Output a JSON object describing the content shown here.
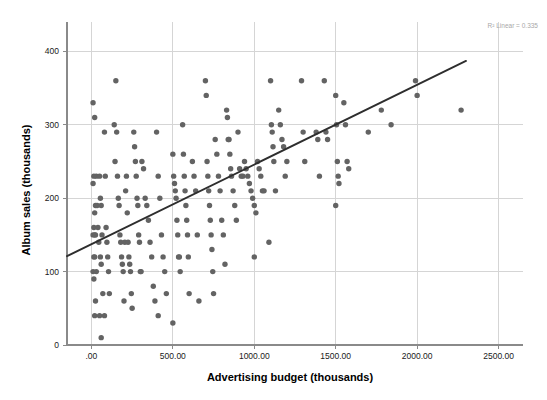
{
  "chart_data": {
    "type": "scatter",
    "title": "",
    "xlabel": "Advertising budget (thousands)",
    "ylabel": "Album sales (thousands)",
    "xlim": [
      -150,
      2650
    ],
    "ylim": [
      0,
      440
    ],
    "grid": true,
    "xticks": [
      0,
      500,
      1000,
      1500,
      2000,
      2500
    ],
    "xticklabels": [
      ".00",
      "500.00",
      "1000.00",
      "1500.00",
      "2000.00",
      "2500.00"
    ],
    "yticks": [
      0,
      100,
      200,
      300,
      400
    ],
    "yticklabels": [
      "0",
      "100",
      "200",
      "300",
      "400"
    ],
    "annotation": "R² Linear = 0.335",
    "annotation_value": 0.335,
    "marker_color": "#636363",
    "fit_line_color": "#2e2e2e",
    "grid_color": "#d5d5d5",
    "axis_color": "#8a8a8a",
    "fit_line": {
      "x0": -150,
      "y0": 121,
      "x1": 2300,
      "y1": 387
    },
    "series": [
      {
        "name": "Album sales",
        "points": [
          [
            10,
            330
          ],
          [
            10,
            220
          ],
          [
            20,
            310
          ],
          [
            15,
            230
          ],
          [
            30,
            230
          ],
          [
            25,
            190
          ],
          [
            20,
            180
          ],
          [
            15,
            160
          ],
          [
            10,
            150
          ],
          [
            20,
            150
          ],
          [
            25,
            150
          ],
          [
            15,
            120
          ],
          [
            20,
            120
          ],
          [
            10,
            100
          ],
          [
            15,
            90
          ],
          [
            30,
            100
          ],
          [
            25,
            60
          ],
          [
            20,
            40
          ],
          [
            35,
            190
          ],
          [
            40,
            160
          ],
          [
            45,
            140
          ],
          [
            50,
            230
          ],
          [
            55,
            200
          ],
          [
            60,
            190
          ],
          [
            65,
            150
          ],
          [
            55,
            120
          ],
          [
            60,
            110
          ],
          [
            70,
            70
          ],
          [
            50,
            40
          ],
          [
            60,
            10
          ],
          [
            80,
            290
          ],
          [
            85,
            230
          ],
          [
            90,
            160
          ],
          [
            95,
            140
          ],
          [
            100,
            120
          ],
          [
            105,
            100
          ],
          [
            110,
            70
          ],
          [
            80,
            40
          ],
          [
            150,
            360
          ],
          [
            140,
            300
          ],
          [
            145,
            250
          ],
          [
            155,
            290
          ],
          [
            160,
            230
          ],
          [
            165,
            200
          ],
          [
            170,
            190
          ],
          [
            175,
            150
          ],
          [
            180,
            140
          ],
          [
            185,
            120
          ],
          [
            190,
            110
          ],
          [
            195,
            100
          ],
          [
            200,
            60
          ],
          [
            205,
            140
          ],
          [
            210,
            210
          ],
          [
            215,
            230
          ],
          [
            220,
            180
          ],
          [
            225,
            140
          ],
          [
            230,
            120
          ],
          [
            235,
            110
          ],
          [
            240,
            100
          ],
          [
            245,
            70
          ],
          [
            250,
            50
          ],
          [
            260,
            290
          ],
          [
            265,
            270
          ],
          [
            270,
            250
          ],
          [
            275,
            230
          ],
          [
            280,
            200
          ],
          [
            285,
            190
          ],
          [
            290,
            150
          ],
          [
            295,
            140
          ],
          [
            300,
            100
          ],
          [
            305,
            100
          ],
          [
            310,
            250
          ],
          [
            320,
            240
          ],
          [
            330,
            200
          ],
          [
            340,
            190
          ],
          [
            350,
            170
          ],
          [
            360,
            140
          ],
          [
            370,
            120
          ],
          [
            380,
            80
          ],
          [
            390,
            60
          ],
          [
            400,
            290
          ],
          [
            410,
            230
          ],
          [
            420,
            200
          ],
          [
            430,
            150
          ],
          [
            440,
            120
          ],
          [
            450,
            100
          ],
          [
            460,
            70
          ],
          [
            410,
            40
          ],
          [
            500,
            260
          ],
          [
            505,
            230
          ],
          [
            510,
            220
          ],
          [
            515,
            210
          ],
          [
            520,
            200
          ],
          [
            525,
            170
          ],
          [
            530,
            150
          ],
          [
            535,
            120
          ],
          [
            540,
            120
          ],
          [
            545,
            100
          ],
          [
            500,
            30
          ],
          [
            560,
            300
          ],
          [
            565,
            260
          ],
          [
            570,
            230
          ],
          [
            575,
            210
          ],
          [
            580,
            190
          ],
          [
            585,
            170
          ],
          [
            590,
            150
          ],
          [
            595,
            120
          ],
          [
            600,
            70
          ],
          [
            620,
            250
          ],
          [
            630,
            230
          ],
          [
            640,
            210
          ],
          [
            650,
            150
          ],
          [
            660,
            60
          ],
          [
            700,
            360
          ],
          [
            705,
            340
          ],
          [
            710,
            250
          ],
          [
            715,
            230
          ],
          [
            720,
            210
          ],
          [
            725,
            190
          ],
          [
            730,
            170
          ],
          [
            735,
            150
          ],
          [
            740,
            130
          ],
          [
            745,
            100
          ],
          [
            750,
            70
          ],
          [
            760,
            280
          ],
          [
            770,
            260
          ],
          [
            780,
            230
          ],
          [
            790,
            210
          ],
          [
            800,
            170
          ],
          [
            810,
            150
          ],
          [
            820,
            110
          ],
          [
            830,
            320
          ],
          [
            835,
            310
          ],
          [
            840,
            280
          ],
          [
            845,
            280
          ],
          [
            850,
            260
          ],
          [
            855,
            240
          ],
          [
            860,
            230
          ],
          [
            870,
            210
          ],
          [
            880,
            190
          ],
          [
            890,
            170
          ],
          [
            900,
            290
          ],
          [
            910,
            240
          ],
          [
            920,
            230
          ],
          [
            930,
            230
          ],
          [
            940,
            250
          ],
          [
            950,
            240
          ],
          [
            960,
            230
          ],
          [
            970,
            220
          ],
          [
            980,
            210
          ],
          [
            990,
            200
          ],
          [
            1000,
            190
          ],
          [
            1010,
            180
          ],
          [
            1020,
            250
          ],
          [
            1030,
            240
          ],
          [
            1040,
            230
          ],
          [
            1050,
            210
          ],
          [
            1060,
            210
          ],
          [
            1000,
            120
          ],
          [
            1090,
            140
          ],
          [
            1100,
            360
          ],
          [
            1105,
            300
          ],
          [
            1110,
            290
          ],
          [
            1115,
            270
          ],
          [
            1120,
            250
          ],
          [
            1130,
            210
          ],
          [
            1150,
            320
          ],
          [
            1160,
            300
          ],
          [
            1170,
            280
          ],
          [
            1180,
            270
          ],
          [
            1190,
            230
          ],
          [
            1200,
            250
          ],
          [
            1290,
            360
          ],
          [
            1300,
            290
          ],
          [
            1310,
            250
          ],
          [
            1380,
            290
          ],
          [
            1390,
            280
          ],
          [
            1400,
            230
          ],
          [
            1430,
            360
          ],
          [
            1440,
            290
          ],
          [
            1450,
            280
          ],
          [
            1500,
            340
          ],
          [
            1505,
            300
          ],
          [
            1510,
            250
          ],
          [
            1515,
            230
          ],
          [
            1520,
            220
          ],
          [
            1500,
            190
          ],
          [
            1550,
            330
          ],
          [
            1560,
            300
          ],
          [
            1570,
            250
          ],
          [
            1580,
            240
          ],
          [
            1700,
            290
          ],
          [
            1780,
            320
          ],
          [
            1840,
            300
          ],
          [
            1990,
            360
          ],
          [
            2000,
            340
          ],
          [
            2270,
            320
          ]
        ]
      }
    ]
  },
  "axes": {
    "x_title": "Advertising budget (thousands)",
    "y_title": "Album sales (thousands)"
  },
  "annotation": {
    "r_squared_label": "R² Linear = 0.335"
  }
}
